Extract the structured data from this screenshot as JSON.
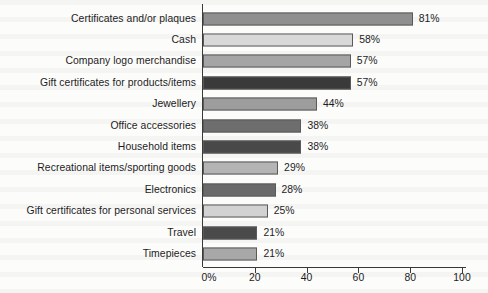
{
  "chart_data": {
    "type": "bar",
    "orientation": "horizontal",
    "title": "",
    "subtitle": "",
    "xlabel": "",
    "ylabel": "",
    "xlim": [
      0,
      100
    ],
    "grid": false,
    "legend": null,
    "x_tick_labels": [
      "0%",
      "20",
      "40",
      "60",
      "80",
      "100"
    ],
    "x_tick_values": [
      0,
      20,
      40,
      60,
      80,
      100
    ],
    "categories": [
      "Certificates and/or plaques",
      "Cash",
      "Company logo merchandise",
      "Gift certificates for products/items",
      "Jewellery",
      "Office accessories",
      "Household items",
      "Recreational items/sporting goods",
      "Electronics",
      "Gift certificates for personal services",
      "Travel",
      "Timepieces"
    ],
    "values": [
      81,
      58,
      57,
      57,
      44,
      38,
      38,
      29,
      28,
      25,
      21,
      21
    ],
    "value_labels": [
      "81%",
      "58%",
      "57%",
      "57%",
      "44%",
      "38%",
      "38%",
      "29%",
      "28%",
      "25%",
      "21%",
      "21%"
    ],
    "bar_colors": [
      "#8f8f8f",
      "#d8d8d8",
      "#a5a5a5",
      "#3a3a3a",
      "#9d9d9d",
      "#6e6e6e",
      "#494949",
      "#b4b4b4",
      "#6a6a6a",
      "#d2d2d2",
      "#4a4a4a",
      "#a8a8a8"
    ],
    "axis_color": "#3a3a3a",
    "bar_edge_color": "#5a5a5a",
    "background_color": "#fcfcfb",
    "text_color": "#1c1c1c"
  }
}
